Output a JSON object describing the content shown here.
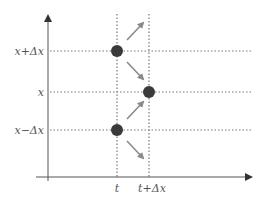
{
  "diagram": {
    "title": "",
    "colors": {
      "axis": "#555555",
      "grid": "#777777",
      "dot": "#3a3a3a",
      "arrow": "#8a8a8a",
      "label": "#555555"
    },
    "y_labels": {
      "upper": "x+Δx",
      "middle": "x",
      "lower": "x−Δx"
    },
    "x_labels": {
      "left": "t",
      "right": "t+Δx"
    },
    "points": [
      {
        "t": "t",
        "x": "x+Δx"
      },
      {
        "t": "t+Δx",
        "x": "x"
      },
      {
        "t": "t",
        "x": "x−Δx"
      }
    ],
    "arrows": [
      {
        "from": "x+Δx",
        "direction": "up-right"
      },
      {
        "from": "x+Δx",
        "direction": "down-right"
      },
      {
        "from": "x−Δx",
        "direction": "up-right"
      },
      {
        "from": "x−Δx",
        "direction": "down-right"
      }
    ]
  }
}
